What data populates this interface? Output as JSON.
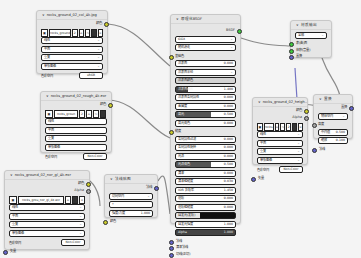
{
  "canvas": {
    "background": "#f4f4f4"
  },
  "nodes": {
    "tex_diffuse": {
      "title": "rocks_ground_02_col_4k.jpg",
      "output_label": "颜色",
      "image_name": "rocks_ground",
      "image_users": "2",
      "dropdowns": [
        "线性",
        "平面",
        "重复",
        "单张图像"
      ],
      "colorspace_label": "色彩空间",
      "colorspace_value": "sRGB"
    },
    "tex_rough": {
      "title": "rocks_ground_02_rough_4k.exr",
      "output_label": "颜色",
      "image_name": "rocks_groun",
      "image_users": "2",
      "dropdowns": [
        "线性",
        "平面",
        "重复",
        "单张图像"
      ],
      "colorspace_label": "色彩空间",
      "colorspace_value": "Non-Color"
    },
    "tex_normal": {
      "title": "rocks_ground_02_nor_gl_4k.exr",
      "output_color": "颜色",
      "output_alpha": "Alpha",
      "image_name": "rocks_grou_nor_gl_4k.exr",
      "dropdowns": [
        "线性",
        "平面",
        "重复",
        "单张图像"
      ],
      "colorspace_label": "色彩空间",
      "colorspace_value": "Non-Color",
      "input_label": "矢量"
    },
    "normal_map": {
      "title": "法线贴图",
      "output_label": "法线",
      "space_value": "切向空间",
      "uv_value": "",
      "strength_label": "强度/力度",
      "strength_value": "1.000",
      "input_label": "颜色"
    },
    "principled": {
      "title": "原理化BSDF",
      "output_label": "BSDF",
      "distribution": "GGX",
      "subsurface_method": "随机游走",
      "rows": [
        {
          "label": "基础色",
          "value": "",
          "style": "label"
        },
        {
          "label": "次表面",
          "value": "0.000",
          "style": "field"
        },
        {
          "label": "次表面半径",
          "value": "",
          "style": "field-chev"
        },
        {
          "label": "次表面颜色",
          "value": "",
          "style": "gray"
        },
        {
          "label": "次表面IOR",
          "value": "1.400",
          "style": "half-small"
        },
        {
          "label": "次表面各向异性",
          "value": "0.000",
          "style": "field"
        },
        {
          "label": "金属度",
          "value": "0.000",
          "style": "field"
        },
        {
          "label": "高光",
          "value": "0.500",
          "style": "half"
        },
        {
          "label": "高光染色",
          "value": "0.000",
          "style": "field"
        },
        {
          "label": "糙度",
          "value": "",
          "style": "label"
        },
        {
          "label": "各向异性过滤",
          "value": "0.000",
          "style": "field"
        },
        {
          "label": "各向异性旋转",
          "value": "0.000",
          "style": "field"
        },
        {
          "label": "光泽",
          "value": "0.000",
          "style": "field"
        },
        {
          "label": "光泽染色",
          "value": "0.500",
          "style": "half"
        },
        {
          "label": "清漆",
          "value": "0.000",
          "style": "field"
        },
        {
          "label": "清漆粗糙度",
          "value": "0.030",
          "style": "field"
        },
        {
          "label": "IOR 折射率",
          "value": "1.450",
          "style": "field"
        },
        {
          "label": "透射",
          "value": "0.000",
          "style": "field"
        },
        {
          "label": "透射粗糙度",
          "value": "0.000",
          "style": "field"
        },
        {
          "label": "自发光(发射)",
          "value": "",
          "style": "black"
        },
        {
          "label": "自发光强度",
          "value": "1.000",
          "style": "field"
        },
        {
          "label": "Alpha",
          "value": "1.000",
          "style": "dark"
        }
      ],
      "inputs_bottom": [
        "法线",
        "清漆法线",
        "切线(正切)"
      ]
    },
    "material_output": {
      "title": "材质输出",
      "target": "全部",
      "inputs": [
        "表(曲)面",
        "体积(音量)",
        "置换"
      ]
    },
    "tex_displace": {
      "title": "rocks_ground_02_heigh...",
      "output_color": "颜色",
      "output_alpha": "Alpha",
      "image_name": "rocks",
      "dropdowns": [
        "线性",
        "平面",
        "重复",
        "单张图像"
      ],
      "colorspace_label": "色彩空间",
      "colorspace_value": "Non-Color",
      "input_label": "矢量"
    },
    "displacement": {
      "title": "置换",
      "output_label": "置换",
      "space_value": "物体空间",
      "section_label": "高度",
      "midlevel_label": "中间值",
      "midlevel_value": "0.500",
      "scale_label": "缩放",
      "scale_value": "0.100",
      "input_label": "法线"
    }
  }
}
